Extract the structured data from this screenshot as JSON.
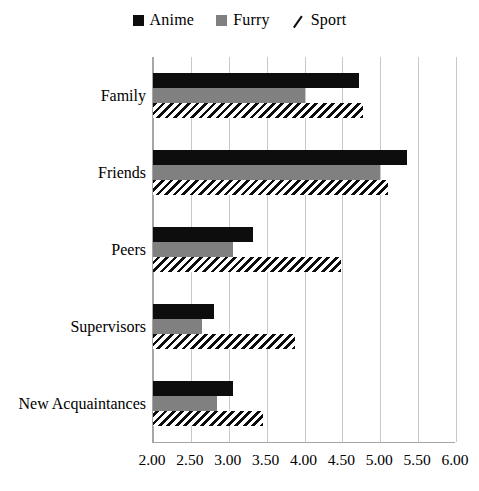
{
  "chart_data": {
    "type": "bar",
    "orientation": "horizontal",
    "title": "",
    "xlabel": "",
    "ylabel": "",
    "xlim": [
      2.0,
      6.0
    ],
    "xticks": [
      "2.00",
      "2.50",
      "3.00",
      "3.50",
      "4.00",
      "4.50",
      "5.00",
      "5.50",
      "6.00"
    ],
    "xtick_values": [
      2.0,
      2.5,
      3.0,
      3.5,
      4.0,
      4.5,
      5.0,
      5.5,
      6.0
    ],
    "grid": "vertical",
    "legend_position": "top-center",
    "categories": [
      "Family",
      "Friends",
      "Peers",
      "Supervisors",
      "New Acquaintances"
    ],
    "series": [
      {
        "name": "Anime",
        "style": "solid-dark",
        "color": "#0d0d0d",
        "values": [
          4.72,
          5.35,
          3.32,
          2.8,
          3.05
        ]
      },
      {
        "name": "Furry",
        "style": "solid-gray",
        "color": "#808080",
        "values": [
          4.0,
          5.0,
          3.05,
          2.65,
          2.85
        ]
      },
      {
        "name": "Sport",
        "style": "diagonal-hatch",
        "color": "#0d0d0d",
        "values": [
          4.77,
          5.1,
          4.48,
          3.87,
          3.45
        ]
      }
    ]
  },
  "legend": {
    "items": [
      {
        "label": "Anime",
        "swatch": "solid-dark-square-icon"
      },
      {
        "label": "Furry",
        "swatch": "solid-gray-square-icon"
      },
      {
        "label": "Sport",
        "swatch": "diagonal-hatch-icon"
      }
    ]
  },
  "colors": {
    "anime": "#0d0d0d",
    "furry": "#808080",
    "sport_hatch": "#0d0d0d",
    "gridline": "#c8c8c8",
    "axis": "#a6a6a6",
    "background": "#ffffff"
  }
}
